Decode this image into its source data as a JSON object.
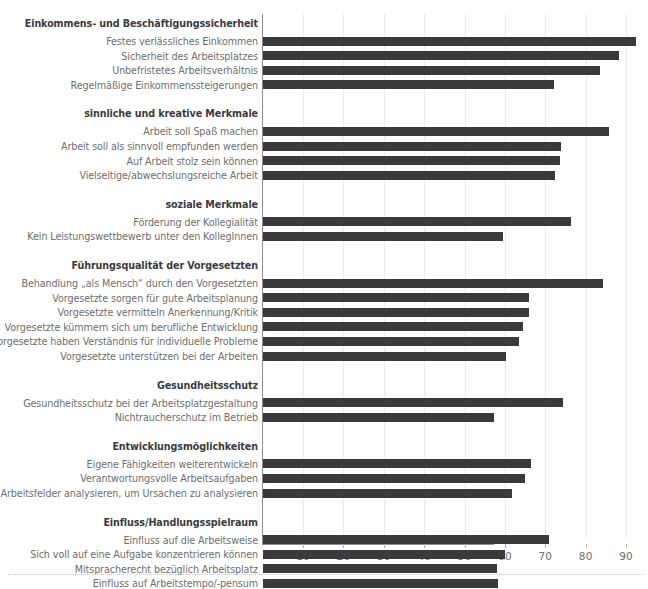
{
  "chart_data": {
    "type": "bar",
    "orientation": "horizontal",
    "title": "",
    "xlabel": "",
    "ylabel": "",
    "xlim": [
      0,
      95
    ],
    "grid": true,
    "legend": "none",
    "xticks": [
      10,
      20,
      30,
      40,
      50,
      60,
      70,
      80,
      90
    ],
    "groups": [
      {
        "heading": "Einkommens- und Beschäftigungssicherheit",
        "categories": [
          "Festes verlässliches Einkommen",
          "Sicherheit des Arbeitsplatzes",
          "Unbefristetes Arbeitsverhältnis",
          "Regelmäßige Einkommenssteigerungen"
        ],
        "values": [
          92.5,
          88.3,
          83.5,
          72.0
        ]
      },
      {
        "heading": "sinnliche und kreative Merkmale",
        "categories": [
          "Arbeit soll Spaß machen",
          "Arbeit soll als sinnvoll empfunden werden",
          "Auf Arbeit stolz sein können",
          "Vielseitige/abwechslungsreiche Arbeit"
        ],
        "values": [
          85.6,
          73.7,
          73.5,
          72.4
        ]
      },
      {
        "heading": "soziale Merkmale",
        "categories": [
          "Förderung der Kollegialität",
          "Kein Leistungswettbewerb unter den KollegInnen"
        ],
        "values": [
          76.3,
          59.4
        ]
      },
      {
        "heading": "Führungsqualität der Vorgesetzten",
        "categories": [
          "Behandlung „als Mensch“ durch den Vorgesetzten",
          "Vorgesetzte sorgen für gute Arbeitsplanung",
          "Vorgesetzte vermitteln Anerkennung/Kritik",
          "Vorgesetzte kümmern sich um berufliche Entwicklung",
          "Vorgesetzte haben Verständnis für individuelle Probleme",
          "Vorgesetzte unterstützen bei der Arbeiten"
        ],
        "values": [
          84.2,
          66.0,
          65.9,
          64.4,
          63.4,
          60.3
        ]
      },
      {
        "heading": "Gesundheitsschutz",
        "categories": [
          "Gesundheitsschutz bei der Arbeitsplatzgestaltung",
          "Nichtraucherschutz im Betrieb"
        ],
        "values": [
          74.3,
          57.3
        ]
      },
      {
        "heading": "Entwicklungsmöglichkeiten",
        "categories": [
          "Eigene Fähigkeiten weiterentwickeln",
          "Verantwortungsvolle Arbeitsaufgaben",
          "Arbeitsfelder analysieren, um Ursachen zu analysieren"
        ],
        "values": [
          66.4,
          64.8,
          61.7
        ]
      },
      {
        "heading": "Einfluss/Handlungsspielraum",
        "categories": [
          "Einfluss auf die Arbeitsweise",
          "Sich voll auf eine Aufgabe konzentrieren können",
          "Mitspracherecht bezüglich Arbeitsplatz",
          "Einfluss auf Arbeitstempo/-pensum"
        ],
        "values": [
          70.9,
          60.0,
          58.0,
          58.2
        ]
      }
    ],
    "colors": {
      "bar": "#3a3a3c",
      "axis": "#8d8d8f",
      "grid": "#e9e9ea",
      "label": "#6e6e70",
      "heading": "#3b3b3d",
      "background": "#ffffff"
    }
  }
}
